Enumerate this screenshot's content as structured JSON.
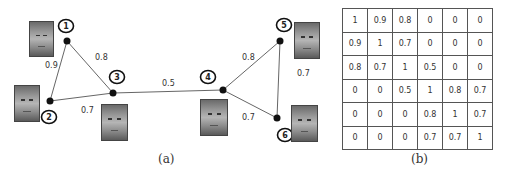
{
  "graph": {
    "caption": "(a)",
    "nodes": [
      {
        "id": "1",
        "x": 67,
        "y": 41,
        "lx": 66,
        "ly": 26
      },
      {
        "id": "2",
        "x": 50,
        "y": 101,
        "lx": 49,
        "ly": 117
      },
      {
        "id": "3",
        "x": 113,
        "y": 93,
        "lx": 117,
        "ly": 77
      },
      {
        "id": "4",
        "x": 223,
        "y": 90,
        "lx": 208,
        "ly": 77
      },
      {
        "id": "5",
        "x": 280,
        "y": 41,
        "lx": 284,
        "ly": 25
      },
      {
        "id": "6",
        "x": 277,
        "y": 118,
        "lx": 285,
        "ly": 135
      }
    ],
    "edges": [
      {
        "from": "1",
        "to": "2",
        "weight": "0.9",
        "lx": 45,
        "ly": 68
      },
      {
        "from": "1",
        "to": "3",
        "weight": "0.8",
        "lx": 95,
        "ly": 60
      },
      {
        "from": "2",
        "to": "3",
        "weight": "0.7",
        "lx": 81,
        "ly": 113
      },
      {
        "from": "3",
        "to": "4",
        "weight": "0.5",
        "lx": 162,
        "ly": 86
      },
      {
        "from": "4",
        "to": "5",
        "weight": "0.8",
        "lx": 242,
        "ly": 60
      },
      {
        "from": "4",
        "to": "6",
        "weight": "0.7",
        "lx": 242,
        "ly": 120
      },
      {
        "from": "5",
        "to": "6",
        "weight": "0.7",
        "lx": 297,
        "ly": 76
      }
    ]
  },
  "matrix": {
    "caption": "(b)",
    "rows": [
      [
        "1",
        "0.9",
        "0.8",
        "0",
        "0",
        "0"
      ],
      [
        "0.9",
        "1",
        "0.7",
        "0",
        "0",
        "0"
      ],
      [
        "0.8",
        "0.7",
        "1",
        "0.5",
        "0",
        "0"
      ],
      [
        "0",
        "0",
        "0.5",
        "1",
        "0.8",
        "0.7"
      ],
      [
        "0",
        "0",
        "0",
        "0.8",
        "1",
        "0.7"
      ],
      [
        "0",
        "0",
        "0",
        "0.7",
        "0.7",
        "1"
      ]
    ]
  }
}
